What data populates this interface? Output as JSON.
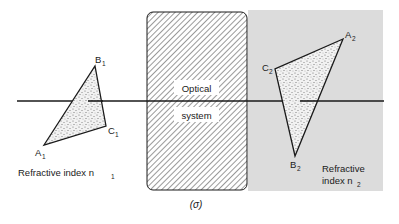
{
  "figure": {
    "caption": "(σ)",
    "optical_system": {
      "line1": "Optical",
      "line2": "system"
    },
    "object_space": {
      "label": "Refractive index n",
      "label_subscript": "1",
      "vertices": [
        {
          "name": "A",
          "sub": "1"
        },
        {
          "name": "B",
          "sub": "1"
        },
        {
          "name": "C",
          "sub": "1"
        }
      ]
    },
    "image_space": {
      "label_line1": "Refractive",
      "label_line2": "index n",
      "label_subscript": "2",
      "vertices": [
        {
          "name": "A",
          "sub": "2"
        },
        {
          "name": "B",
          "sub": "2"
        },
        {
          "name": "C",
          "sub": "2"
        }
      ]
    },
    "colors": {
      "ink": "#1a1a1a",
      "image_space_bg": "#dcdcdc",
      "label_bg": "#ffffff"
    }
  }
}
